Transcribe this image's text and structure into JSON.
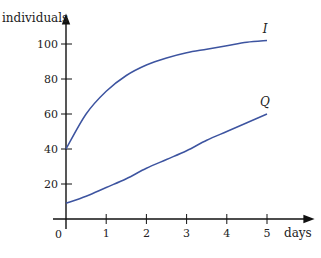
{
  "chart_data": {
    "type": "line",
    "title": "",
    "xlabel": "days",
    "ylabel": "individuals",
    "xlim": [
      0,
      5
    ],
    "ylim": [
      0,
      110
    ],
    "grid": false,
    "legend": "inline labels at curve ends",
    "x_ticks": [
      "0",
      "1",
      "2",
      "3",
      "4",
      "5"
    ],
    "y_ticks": [
      "20",
      "40",
      "60",
      "80",
      "100"
    ],
    "x": [
      0,
      0.5,
      1,
      1.5,
      2,
      2.5,
      3,
      3.5,
      4,
      4.5,
      5
    ],
    "series": [
      {
        "name": "I",
        "values": [
          40,
          60,
          73,
          82,
          88,
          92,
          95,
          97,
          99,
          101,
          102
        ]
      },
      {
        "name": "Q",
        "values": [
          9,
          13,
          18,
          23,
          29,
          34,
          39,
          45,
          50,
          55,
          60
        ]
      }
    ],
    "colors": {
      "curve": "#3d54a0",
      "axis": "#111111"
    }
  }
}
